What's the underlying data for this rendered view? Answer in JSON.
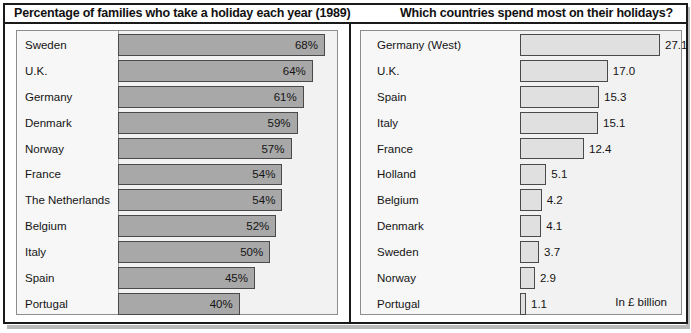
{
  "figure": {
    "panels": [
      {
        "id": "left",
        "title": "Percentage of families who take a holiday each year (1989)"
      },
      {
        "id": "right",
        "title": "Which countries spend most on their holidays?",
        "unit_note": "In £ billion"
      }
    ]
  },
  "chart_data": [
    {
      "type": "bar",
      "orientation": "horizontal",
      "title": "Percentage of families who take a holiday each year (1989)",
      "xlabel": "",
      "ylabel": "",
      "unit": "%",
      "grid": false,
      "legend": "none",
      "xlim": [
        0,
        68
      ],
      "categories": [
        "Sweden",
        "U.K.",
        "Germany",
        "Denmark",
        "Norway",
        "France",
        "The Netherlands",
        "Belgium",
        "Italy",
        "Spain",
        "Portugal"
      ],
      "values": [
        68,
        64,
        61,
        59,
        57,
        54,
        54,
        52,
        50,
        45,
        40
      ],
      "data_labels": [
        "68%",
        "64%",
        "61%",
        "59%",
        "57%",
        "54%",
        "54%",
        "52%",
        "50%",
        "45%",
        "40%"
      ]
    },
    {
      "type": "bar",
      "orientation": "horizontal",
      "title": "Which countries spend most on their holidays?",
      "xlabel": "",
      "ylabel": "",
      "unit": "£ billion",
      "annotation": "In £ billion",
      "grid": false,
      "legend": "none",
      "xlim": [
        0,
        27.1
      ],
      "categories": [
        "Germany (West)",
        "U.K.",
        "Spain",
        "Italy",
        "France",
        "Holland",
        "Belgium",
        "Denmark",
        "Sweden",
        "Norway",
        "Portugal"
      ],
      "values": [
        27.1,
        17.0,
        15.3,
        15.1,
        12.4,
        5.1,
        4.2,
        4.1,
        3.7,
        2.9,
        1.1
      ],
      "data_labels": [
        "27.1",
        "17.0",
        "15.3",
        "15.1",
        "12.4",
        "5.1",
        "4.2",
        "4.1",
        "3.7",
        "2.9",
        "1.1"
      ]
    }
  ],
  "colors": {
    "frame": "#1a1a1a",
    "panel_background": "#f2f2f2",
    "left_bar_fill": "#a8a8a8",
    "right_bar_fill": "#e0e0e0",
    "bar_outline": "#4a4a4a",
    "text": "#141414"
  }
}
